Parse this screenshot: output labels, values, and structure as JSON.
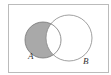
{
  "diagram": {
    "type": "venn",
    "shaded_region": "A minus B",
    "sets": [
      {
        "label": "A"
      },
      {
        "label": "B"
      }
    ],
    "colors": {
      "border": "#bbbbbb",
      "circle_stroke": "#777777",
      "shade": "#a9a9a9",
      "background": "#ffffff"
    }
  }
}
